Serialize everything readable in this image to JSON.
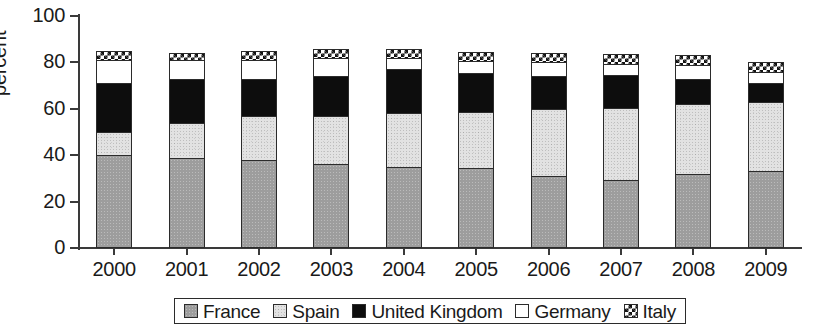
{
  "chart_data": {
    "type": "bar",
    "subtype": "stacked-vertical",
    "title": "",
    "xlabel": "",
    "ylabel": "percent",
    "ylim": [
      0,
      100
    ],
    "yticks": [
      0,
      20,
      40,
      60,
      80,
      100
    ],
    "grid": false,
    "legend_position": "bottom",
    "categories": [
      "2000",
      "2001",
      "2002",
      "2003",
      "2004",
      "2005",
      "2006",
      "2007",
      "2008",
      "2009"
    ],
    "series": [
      {
        "name": "France",
        "pattern": "dark-gray-stipple",
        "color": "#9d9d9d",
        "values": [
          40,
          39,
          38,
          36,
          35,
          34.5,
          31,
          29.5,
          32,
          33
        ]
      },
      {
        "name": "Spain",
        "pattern": "light-gray-stipple",
        "color": "#e2e2e2",
        "values": [
          10,
          15,
          19,
          21,
          23,
          24,
          29,
          31,
          30,
          30
        ]
      },
      {
        "name": "United Kingdom",
        "pattern": "solid-black",
        "color": "#0d0d0d",
        "values": [
          21,
          19,
          16,
          17,
          19,
          17,
          14,
          14,
          11,
          8
        ]
      },
      {
        "name": "Germany",
        "pattern": "white-open",
        "color": "#ffffff",
        "values": [
          10,
          8,
          8,
          8,
          5,
          5,
          6,
          5,
          6,
          5
        ]
      },
      {
        "name": "Italy",
        "pattern": "black-white-checker",
        "color": "#ffffff",
        "values": [
          4,
          3,
          4,
          4,
          4,
          4,
          4,
          4,
          4,
          4
        ]
      }
    ],
    "totals": [
      85,
      84,
      85,
      86,
      86,
      84.5,
      84,
      83.5,
      83,
      80
    ]
  },
  "axis": {
    "y_title": "percent",
    "y_tick_labels": [
      "100",
      "80",
      "60",
      "40",
      "20",
      "0"
    ],
    "x_tick_labels": [
      "2000",
      "2001",
      "2002",
      "2003",
      "2004",
      "2005",
      "2006",
      "2007",
      "2008",
      "2009"
    ]
  },
  "legend": {
    "items": [
      {
        "label": "France",
        "swatch": "swatch-france"
      },
      {
        "label": "Spain",
        "swatch": "swatch-spain"
      },
      {
        "label": "United Kingdom",
        "swatch": "swatch-united-kingdom"
      },
      {
        "label": "Germany",
        "swatch": "swatch-germany"
      },
      {
        "label": "Italy",
        "swatch": "swatch-italy"
      }
    ]
  }
}
